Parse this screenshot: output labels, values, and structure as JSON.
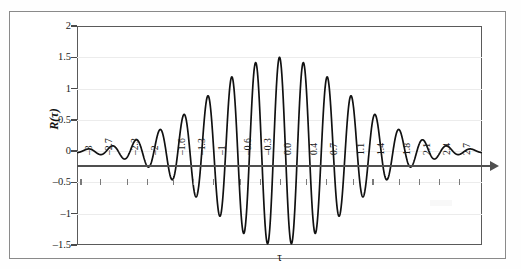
{
  "figure": {
    "background": "#ffffff",
    "frame_color": "#8a8a8a",
    "axis_color": "#4f4f4f",
    "curve_color": "#111111",
    "grid_color": "#ececec"
  },
  "chart_data": {
    "type": "line",
    "title": "",
    "xlabel": "τ",
    "ylabel": "R(τ)",
    "xlim": [
      -3.05,
      3.05
    ],
    "ylim": [
      -1.5,
      2
    ],
    "grid": true,
    "legend": null,
    "y_ticks": [
      2,
      1.5,
      1,
      0.5,
      0,
      -0.5,
      -1,
      -1.5
    ],
    "y_tick_labels": [
      "2",
      "1.5",
      "1",
      "0.5",
      "0",
      "–0.5",
      "–1",
      "–1.5"
    ],
    "x_tick_labels": [
      "–3",
      "–2.7",
      "–2.3",
      "–2",
      "–1.6",
      "–1.3",
      "–1",
      "–0.6",
      "–0.3",
      "0.0",
      "0.4",
      "0.7",
      "1.1",
      "1.4",
      "1.8",
      "2.1",
      "2.4",
      "2.7"
    ],
    "x_tick_values": [
      -3.0,
      -2.7,
      -2.3,
      -2.0,
      -1.6,
      -1.3,
      -1.0,
      -0.6,
      -0.3,
      0.0,
      0.4,
      0.7,
      1.1,
      1.4,
      1.8,
      2.1,
      2.4,
      2.7
    ],
    "series": [
      {
        "name": "R(tau)",
        "description": "Damped oscillatory autocorrelation: Gaussian-like envelope times cosine carrier",
        "peak_value": 1.5,
        "peak_at": 0.0,
        "min_value": -1.28,
        "envelope_sigma": 1.05,
        "carrier_period": 0.36,
        "baseline": 0.0,
        "local_maxima": [
          {
            "x": -2.93,
            "y": 0.1
          },
          {
            "x": -2.57,
            "y": 0.13
          },
          {
            "x": -2.21,
            "y": 0.17
          },
          {
            "x": -1.85,
            "y": 0.22
          },
          {
            "x": -1.49,
            "y": 0.3
          },
          {
            "x": -1.13,
            "y": 0.43
          },
          {
            "x": -0.9,
            "y": 0.59
          },
          {
            "x": -0.72,
            "y": 0.8
          },
          {
            "x": -0.54,
            "y": 1.08
          },
          {
            "x": -0.18,
            "y": 1.5
          },
          {
            "x": 0.18,
            "y": 1.08
          },
          {
            "x": 0.36,
            "y": 0.8
          },
          {
            "x": 0.72,
            "y": 0.59
          },
          {
            "x": 1.08,
            "y": 0.43
          },
          {
            "x": 1.44,
            "y": 0.3
          },
          {
            "x": 1.8,
            "y": 0.23
          },
          {
            "x": 2.16,
            "y": 0.18
          },
          {
            "x": 2.52,
            "y": 0.14
          },
          {
            "x": 2.88,
            "y": 0.1
          }
        ],
        "local_minima": [
          {
            "x": -2.75,
            "y": -0.12
          },
          {
            "x": -2.39,
            "y": -0.15
          },
          {
            "x": -2.03,
            "y": -0.19
          },
          {
            "x": -1.67,
            "y": -0.26
          },
          {
            "x": -1.31,
            "y": -0.36
          },
          {
            "x": -0.95,
            "y": -0.5
          },
          {
            "x": -0.63,
            "y": -0.66
          },
          {
            "x": -0.45,
            "y": -0.89
          },
          {
            "x": -0.27,
            "y": -1.26
          },
          {
            "x": 0.09,
            "y": -1.27
          },
          {
            "x": 0.27,
            "y": -0.89
          },
          {
            "x": 0.45,
            "y": -0.66
          },
          {
            "x": 0.81,
            "y": -0.5
          },
          {
            "x": 1.17,
            "y": -0.37
          },
          {
            "x": 1.53,
            "y": -0.27
          },
          {
            "x": 1.89,
            "y": -0.2
          },
          {
            "x": 2.25,
            "y": -0.16
          },
          {
            "x": 2.61,
            "y": -0.12
          },
          {
            "x": 2.97,
            "y": -0.09
          }
        ]
      }
    ]
  }
}
